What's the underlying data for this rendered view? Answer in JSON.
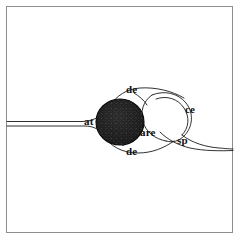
{
  "figure": {
    "kind": "line-drawing-diagram",
    "background_color": "#ffffff",
    "ink_color": "#111111",
    "frame": {
      "stroke_color": "#808080",
      "x": 6,
      "y": 6,
      "width": 227,
      "height": 227
    },
    "soma": {
      "name": "cell-body",
      "center_x": 120,
      "center_y": 122,
      "radius_x": 24,
      "radius_y": 23,
      "fill_color": "#1a1a1a",
      "texture": "stippled"
    },
    "labels": [
      {
        "id": "de-top",
        "text": "de",
        "x": 126,
        "y": 84
      },
      {
        "id": "at",
        "text": "at",
        "x": 84,
        "y": 116
      },
      {
        "id": "are",
        "text": "are",
        "x": 140,
        "y": 127
      },
      {
        "id": "ce",
        "text": "ce",
        "x": 185,
        "y": 104
      },
      {
        "id": "sp",
        "text": "sp",
        "x": 177,
        "y": 135
      },
      {
        "id": "de-bot",
        "text": "de",
        "x": 126,
        "y": 146
      }
    ]
  }
}
